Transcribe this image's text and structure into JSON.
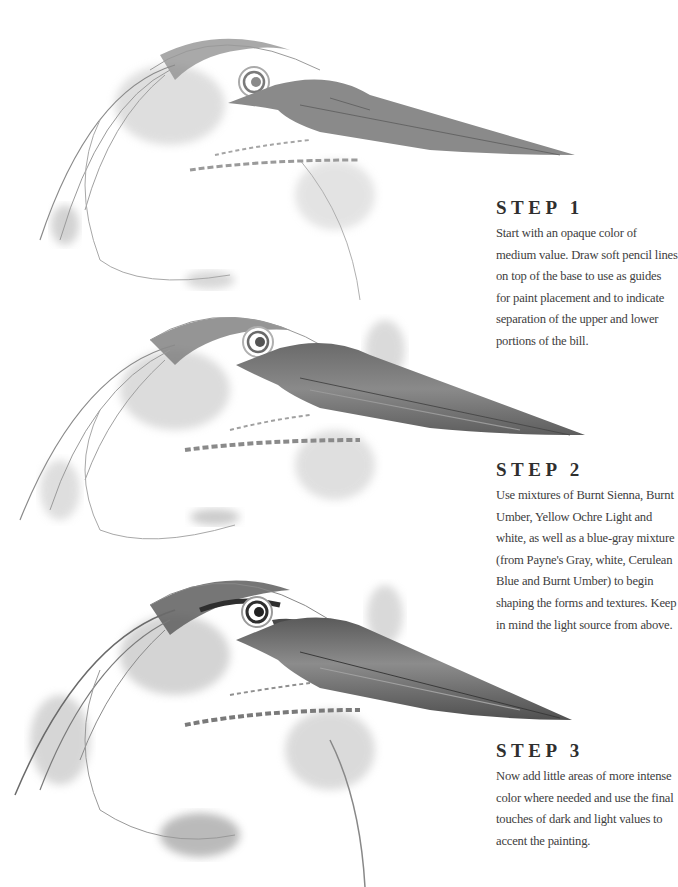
{
  "page": {
    "steps": [
      {
        "title": "STEP 1",
        "body": "Start with an opaque color of medium value. Draw soft pencil lines on top of the base to use as guides for paint placement and to indicate separation of the upper and lower portions of the bill."
      },
      {
        "title": "STEP 2",
        "body": "Use mixtures of Burnt Sienna, Burnt Umber, Yellow Ochre Light and white, as well as a blue-gray mixture (from Payne's Gray, white, Cerulean Blue and Burnt Umber) to begin shaping the forms and textures. Keep in mind the light source from above."
      },
      {
        "title": "STEP 3",
        "body": "Now add little areas of more intense color where needed and use the final touches of dark and light values to accent the painting."
      }
    ],
    "colors": {
      "background": "#ffffff",
      "text": "#404040",
      "heading": "#2f2f2f",
      "bill_step1": "#8a8a8a",
      "bill_step3": "#6e6e6e",
      "wash": "#bdbdbd"
    }
  }
}
